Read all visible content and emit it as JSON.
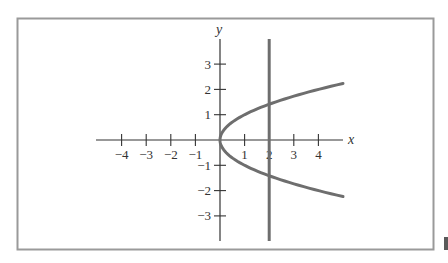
{
  "chart_data": {
    "type": "line",
    "title": "",
    "xlabel": "x",
    "ylabel": "y",
    "xlim": [
      -5,
      5
    ],
    "ylim": [
      -4,
      4
    ],
    "grid": false,
    "legend": null,
    "x_ticks": [
      -4,
      -3,
      -2,
      -1,
      1,
      2,
      3,
      4
    ],
    "y_ticks": [
      3,
      2,
      1,
      -1,
      -2,
      -3
    ],
    "x_tick_labels": [
      "−4",
      "−3",
      "−2",
      "−1",
      "1",
      "2",
      "3",
      "4"
    ],
    "y_tick_labels": [
      "3",
      "2",
      "1",
      "−1",
      "−2",
      "−3"
    ],
    "series": [
      {
        "name": "parabola y^2 = x",
        "equation": "x = y^2",
        "color": "#6e6e6e",
        "points": [
          {
            "x": 5.0,
            "y": 2.236
          },
          {
            "x": 4.0,
            "y": 2.0
          },
          {
            "x": 3.0,
            "y": 1.732
          },
          {
            "x": 2.0,
            "y": 1.414
          },
          {
            "x": 1.0,
            "y": 1.0
          },
          {
            "x": 0.25,
            "y": 0.5
          },
          {
            "x": 0.0,
            "y": 0.0
          },
          {
            "x": 0.25,
            "y": -0.5
          },
          {
            "x": 1.0,
            "y": -1.0
          },
          {
            "x": 2.0,
            "y": -1.414
          },
          {
            "x": 3.0,
            "y": -1.732
          },
          {
            "x": 4.0,
            "y": -2.0
          },
          {
            "x": 5.0,
            "y": -2.236
          }
        ]
      },
      {
        "name": "vertical line x = 2",
        "equation": "x = 2",
        "color": "#6e6e6e",
        "points": [
          {
            "x": 2,
            "y": 4
          },
          {
            "x": 2,
            "y": -4
          }
        ]
      }
    ],
    "intersections": [
      {
        "x": 2,
        "y": 1.414
      },
      {
        "x": 2,
        "y": -1.414
      }
    ]
  },
  "colors": {
    "frame": "#9a9a9a",
    "axes": "#333333",
    "curve": "#6e6e6e",
    "corner_block": "#5a5a5a"
  }
}
